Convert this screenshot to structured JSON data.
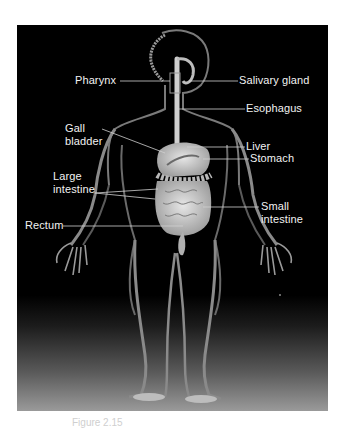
{
  "diagram": {
    "labels": {
      "pharynx": "Pharynx",
      "salivary_gland": "Salivary gland",
      "esophagus": "Esophagus",
      "gall_bladder_1": "Gall",
      "gall_bladder_2": "bladder",
      "liver": "Liver",
      "stomach": "Stomach",
      "large_intestine_1": "Large",
      "large_intestine_2": "intestine",
      "small_intestine_1": "Small",
      "small_intestine_2": "intestine",
      "rectum": "Rectum"
    },
    "caption": "Figure 2.15"
  },
  "colors": {
    "background": "#000000",
    "label_text": "#f2f2f2",
    "leader_line": "#d0d0d0",
    "body_outline": "#8a8a8a",
    "organ_fill": "#c8c8c8",
    "page": "#ffffff"
  }
}
